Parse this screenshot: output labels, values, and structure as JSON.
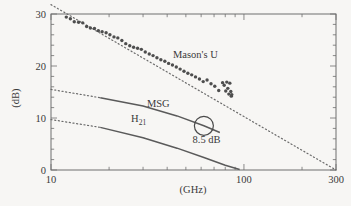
{
  "chart_data": {
    "type": "scatter",
    "title": "",
    "xlabel": "(GHz)",
    "ylabel": "(dB)",
    "xscale": "log",
    "xlim": [
      10,
      300
    ],
    "ylim": [
      0,
      30
    ],
    "xticks": [
      10,
      100,
      300
    ],
    "xtick_labels": [
      "10",
      "100",
      "300"
    ],
    "yticks": [
      0,
      10,
      20,
      30
    ],
    "ytick_labels": [
      "0",
      "10",
      "20",
      "30"
    ],
    "grid": false,
    "legend_position": "inline-annotations",
    "annotations": [
      {
        "name": "masons-u-label",
        "text": "Mason's U",
        "x_ghz": 56,
        "y_db": 21.5
      },
      {
        "name": "msg-label",
        "text": "MSG",
        "x_ghz": 36,
        "y_db": 12.2
      },
      {
        "name": "h21-label",
        "text": "H",
        "subscript": "21",
        "x_ghz": 26,
        "y_db": 9.2
      },
      {
        "name": "gain-callout-label",
        "text": "8.5 dB",
        "x_ghz": 64,
        "y_db": 5.2
      }
    ],
    "marker_circle": {
      "name": "operating-point-marker",
      "x_ghz": 62,
      "y_db": 8.5,
      "radius_px": 9.5
    },
    "series": [
      {
        "name": "Mason's U",
        "style": "scatter",
        "x": [
          12.0,
          12.6,
          13.2,
          13.9,
          14.6,
          15.3,
          16.0,
          16.8,
          17.6,
          18.4,
          19.3,
          20.2,
          21.2,
          22.2,
          23.3,
          24.4,
          25.6,
          26.8,
          28.1,
          29.4,
          30.8,
          32.3,
          33.8,
          35.4,
          37.1,
          38.9,
          40.7,
          42.6,
          44.6,
          46.7,
          48.9,
          51.2,
          53.6,
          56.1,
          58.8,
          61.5,
          64.4,
          67.5,
          70.6,
          74.0,
          77.5,
          79.0,
          80.5,
          81.5,
          82.5,
          83.5,
          84.5,
          85.5,
          86.0,
          86.5
        ],
        "y": [
          29.4,
          29.1,
          28.5,
          28.4,
          28.3,
          27.6,
          27.3,
          27.2,
          26.8,
          26.6,
          26.4,
          26.0,
          25.6,
          25.4,
          24.9,
          24.3,
          23.9,
          23.6,
          23.4,
          23.2,
          22.7,
          22.3,
          22.0,
          21.6,
          21.2,
          20.9,
          20.5,
          20.2,
          19.8,
          19.4,
          19.0,
          18.6,
          18.3,
          17.9,
          17.5,
          17.0,
          17.3,
          16.6,
          16.1,
          15.3,
          16.8,
          16.3,
          15.2,
          16.9,
          15.7,
          14.6,
          16.7,
          15.1,
          14.2,
          14.5
        ]
      },
      {
        "name": "Mason's U extrapolation",
        "style": "dotted",
        "x": [
          10,
          300
        ],
        "y": [
          31.8,
          0.0
        ]
      },
      {
        "name": "MSG",
        "style": "solid",
        "x": [
          18,
          30,
          45,
          62,
          75
        ],
        "y": [
          13.9,
          12.3,
          10.4,
          8.5,
          7.2
        ]
      },
      {
        "name": "MSG extrapolation",
        "style": "dotted",
        "x": [
          10,
          18
        ],
        "y": [
          15.5,
          13.9
        ]
      },
      {
        "name": "H21",
        "style": "solid",
        "x": [
          18,
          30,
          45,
          62,
          80,
          95
        ],
        "y": [
          8.2,
          6.2,
          4.2,
          2.4,
          0.9,
          0.1
        ]
      },
      {
        "name": "H21 extrapolation",
        "style": "dotted",
        "x": [
          10,
          18
        ],
        "y": [
          9.7,
          8.2
        ]
      }
    ]
  },
  "colors": {
    "background": "#f7f6f4",
    "frame": "#6e6e6e",
    "data": "#4e4e4e",
    "text": "#3a3a3a"
  }
}
